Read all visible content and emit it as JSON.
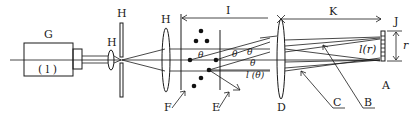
{
  "diagram": {
    "labels": {
      "G": "G",
      "G_inner": "( l )",
      "H_lens_small": "H",
      "H_pinhole": "H",
      "H_lens_large": "H",
      "I": "I",
      "K": "K",
      "J": "J",
      "A": "A",
      "B": "B",
      "C": "C",
      "D": "D",
      "E": "E",
      "F": "F",
      "r": "r",
      "I_r": "l(r)",
      "I_theta": "l (θ)",
      "theta": "θ"
    },
    "components": [
      {
        "id": "G",
        "name": "laser source"
      },
      {
        "id": "H",
        "name": "beam expander (lens, pinhole, collimating lens)"
      },
      {
        "id": "F",
        "name": "particle sample"
      },
      {
        "id": "E",
        "name": "scattered light"
      },
      {
        "id": "D",
        "name": "Fourier lens"
      },
      {
        "id": "C",
        "name": "unscattered beam"
      },
      {
        "id": "B",
        "name": "scattered beam"
      },
      {
        "id": "A",
        "name": "detector array"
      },
      {
        "id": "J",
        "name": "detector element"
      },
      {
        "id": "I",
        "name": "distance sample to lens"
      },
      {
        "id": "K",
        "name": "focal length"
      }
    ],
    "colors": {
      "ink": "#1a1a1a",
      "background": "#ffffff"
    }
  }
}
